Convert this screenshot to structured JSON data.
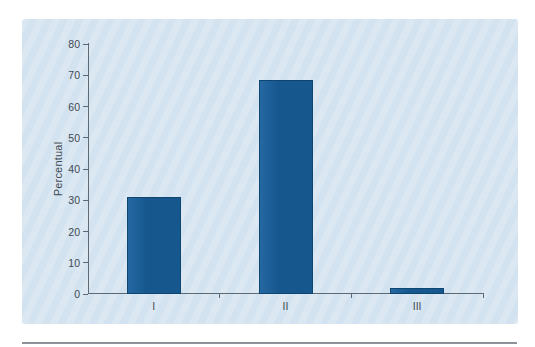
{
  "figure": {
    "ylabel": "Percentual",
    "colors": {
      "page_background": "#ffffff",
      "panel_background": "#d7e5f1",
      "bar_fill": "#16578e",
      "bar_fill_light": "#2568a2",
      "bar_border": "#0e4672",
      "axis": "#5d6a73",
      "text": "#3e4a53",
      "bottom_rule": "#8d9299"
    }
  },
  "chart_data": {
    "type": "bar",
    "categories": [
      "I",
      "II",
      "III"
    ],
    "values": [
      31,
      68.5,
      2
    ],
    "title": "",
    "xlabel": "",
    "ylabel": "Percentual",
    "ylim": [
      0,
      80
    ],
    "yticks": [
      0,
      10,
      20,
      30,
      40,
      50,
      60,
      70,
      80
    ],
    "grid": false,
    "legend": null
  }
}
